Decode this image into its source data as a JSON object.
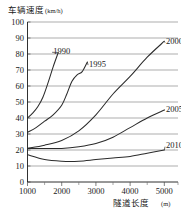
{
  "chart_data": {
    "type": "line",
    "ylabel": "车辆速度(km/h)",
    "xlabel": "隧道长度(m)",
    "xlabel_text": "隧道长度",
    "xlabel_unit": "(m)",
    "ylabel_text": "车辆速度",
    "ylabel_unit": "(km/h)",
    "grid": true,
    "legend_position": "inline-right",
    "xlim": [
      1000,
      5400
    ],
    "ylim": [
      0,
      100
    ],
    "x_ticks": [
      1000,
      2000,
      3000,
      4000,
      5000
    ],
    "x_tick_labels": [
      "1000",
      "2000",
      "3000",
      "4000",
      "5000"
    ],
    "x_minor_ticks": [
      1500,
      2500,
      3500,
      4500,
      5400
    ],
    "y_ticks": [
      0,
      10,
      20,
      30,
      40,
      50,
      60,
      70,
      80,
      90,
      100
    ],
    "y_tick_labels": [
      "0",
      "10",
      "20",
      "30",
      "40",
      "50",
      "60",
      "70",
      "80",
      "90",
      "100"
    ],
    "x": [
      1000,
      1250,
      1500,
      1750,
      2000,
      2250,
      2500,
      2750,
      3000,
      3250,
      3500,
      3750,
      4000,
      4250,
      4500,
      4750,
      5000
    ],
    "series": [
      {
        "name": "1990",
        "label": "1990",
        "label_x": 1750,
        "label_y": 82,
        "x": [
          1000,
          1150,
          1300,
          1450,
          1600,
          1750,
          1900
        ],
        "values": [
          40,
          43,
          47,
          53,
          62,
          72,
          81
        ]
      },
      {
        "name": "1995",
        "label": "1995",
        "label_x": 2800,
        "label_y": 74,
        "x": [
          1000,
          1250,
          1500,
          1750,
          2000,
          2150,
          2300,
          2450,
          2600,
          2750
        ],
        "values": [
          31,
          34,
          38,
          42,
          48,
          55,
          63,
          67,
          69,
          75
        ]
      },
      {
        "name": "2000",
        "label": "2000",
        "label_x": 5050,
        "label_y": 88,
        "x": [
          1000,
          1500,
          2000,
          2500,
          3000,
          3500,
          4000,
          4500,
          5000
        ],
        "values": [
          21,
          23,
          26,
          32,
          42,
          55,
          66,
          78,
          88
        ]
      },
      {
        "name": "2005",
        "label": "2005",
        "label_x": 5050,
        "label_y": 46,
        "x": [
          1000,
          1500,
          2000,
          2500,
          3000,
          3500,
          4000,
          4500,
          5000
        ],
        "values": [
          21,
          21,
          21,
          22,
          24,
          28,
          34,
          40,
          45
        ]
      },
      {
        "name": "2010",
        "label": "2010",
        "label_x": 5050,
        "label_y": 23,
        "x": [
          1000,
          1500,
          2000,
          2500,
          3000,
          3500,
          4000,
          4500,
          5000
        ],
        "values": [
          17,
          14,
          13,
          13,
          14,
          15,
          16,
          18,
          20
        ]
      }
    ]
  }
}
